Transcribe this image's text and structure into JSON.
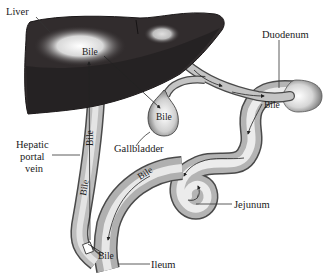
{
  "diagram": {
    "organs": {
      "liver": "Liver",
      "duodenum": "Duodenum",
      "gallbladder": "Gallbladder",
      "hepatic_portal_vein": [
        "Hepatic",
        "portal",
        "vein"
      ],
      "jejunum": "Jejunum",
      "ileum": "Ileum"
    },
    "flow_labels": {
      "liver": "Bile",
      "gallbladder": "Bile",
      "duodenum": "Bile",
      "intestine": "Bile",
      "ileum": "Bile",
      "portal_upper": "Bile",
      "portal_lower": "Bile"
    },
    "colors": {
      "liver_dark": "#2e2a2b",
      "liver_highlight": "#f4f4f4",
      "tube_mid": "#a9a9a9",
      "tube_light": "#f2f2f2",
      "tube_edge": "#4a4a4a",
      "background": "#ffffff"
    }
  }
}
